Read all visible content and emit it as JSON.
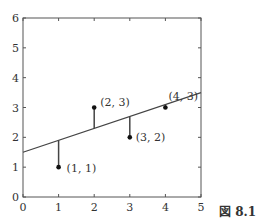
{
  "figure_label": "図 8.1",
  "chart_data": {
    "type": "scatter",
    "title": "",
    "xlabel": "",
    "ylabel": "",
    "xlim": [
      0,
      5
    ],
    "ylim": [
      0,
      6
    ],
    "x_ticks": [
      0,
      1,
      2,
      3,
      4,
      5
    ],
    "y_ticks": [
      0,
      1,
      2,
      3,
      4,
      5,
      6
    ],
    "grid": false,
    "points": [
      {
        "x": 1,
        "y": 1,
        "label": "(1, 1)"
      },
      {
        "x": 2,
        "y": 3,
        "label": "(2, 3)"
      },
      {
        "x": 3,
        "y": 2,
        "label": "(3, 2)"
      },
      {
        "x": 4,
        "y": 3,
        "label": "(4, 3)"
      }
    ],
    "regression_line": {
      "intercept": 1.5,
      "slope": 0.4,
      "x_range": [
        0,
        5
      ]
    },
    "residual_lines": true,
    "colors": {
      "axis": "#555555",
      "line": "#444444",
      "point": "#111111"
    }
  }
}
